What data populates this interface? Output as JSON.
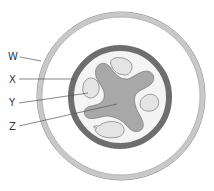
{
  "diagram": {
    "type": "root-cross-section",
    "labels": [
      {
        "id": "W",
        "text": "W"
      },
      {
        "id": "X",
        "text": "X"
      },
      {
        "id": "Y",
        "text": "Y"
      },
      {
        "id": "Z",
        "text": "Z"
      }
    ],
    "colors": {
      "outer_ring": "#c8c8c8",
      "inner_ring": "#6e6e6e",
      "xylem": "#a8a8a8",
      "phloem": "#e4e4e4",
      "background": "#ffffff",
      "outline": "#777777"
    }
  }
}
